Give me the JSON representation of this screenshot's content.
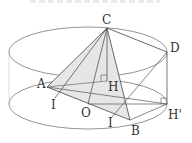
{
  "figure": {
    "points": {
      "C": {
        "label": "C",
        "x": 107,
        "y": 28
      },
      "D": {
        "label": "D",
        "x": 167,
        "y": 52
      },
      "H": {
        "label": "H",
        "x": 107,
        "y": 81
      },
      "A": {
        "label": "A",
        "x": 47,
        "y": 87
      },
      "O": {
        "label": "O",
        "x": 88,
        "y": 104
      },
      "Hp": {
        "label": "H'",
        "x": 167,
        "y": 104
      },
      "B": {
        "label": "B",
        "x": 130,
        "y": 120
      },
      "I1": {
        "label": "I",
        "x": 55,
        "y": 98
      },
      "I2": {
        "label": "I",
        "x": 112,
        "y": 117
      }
    },
    "colors": {
      "line": "#555555",
      "fill": "#e6e6e6"
    }
  }
}
